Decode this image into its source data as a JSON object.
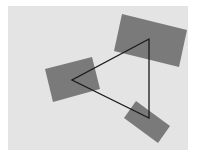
{
  "diagram": {
    "background_color": "#ffffff",
    "panel": {
      "x": 8,
      "y": 6,
      "width": 180,
      "height": 144,
      "fill": "#e4e4e4"
    },
    "rectangles": [
      {
        "id": "top-right",
        "points": "122,14 187,30 179,67 114,51",
        "fill": "#7a7a7a"
      },
      {
        "id": "left",
        "points": "45,69 92,57 100,89 53,102",
        "fill": "#7a7a7a"
      },
      {
        "id": "bottom-right",
        "points": "136,101 170,126 158,143 124,118",
        "fill": "#7a7a7a"
      }
    ],
    "triangle": {
      "points": "149,39 149,118 72,80",
      "stroke": "#1a1a1a",
      "stroke_width": 1.3,
      "vertices": [
        {
          "x": 149,
          "y": 39
        },
        {
          "x": 149,
          "y": 118
        },
        {
          "x": 72,
          "y": 80
        }
      ]
    }
  }
}
